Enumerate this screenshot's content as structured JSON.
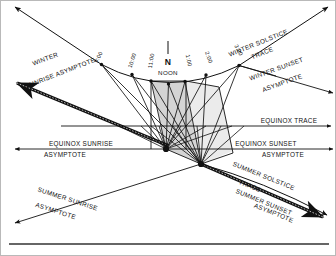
{
  "figure": {
    "background_color": "#ffffff",
    "ink_color": "#111111",
    "frame_color": "#b9b9b9",
    "shade_color": "#c9c9c9"
  },
  "cardinal": {
    "north_label": "N",
    "noon_label": "NOON"
  },
  "hour_marks": [
    {
      "id": "h9",
      "label": "9:00",
      "x": 99,
      "y": 57,
      "rotate": -62,
      "node_x": 100.5,
      "node_y": 63.5
    },
    {
      "id": "h10",
      "label": "10:00",
      "x": 133,
      "y": 60,
      "rotate": -72,
      "node_x": 131,
      "node_y": 73.5
    },
    {
      "id": "h11",
      "label": "11:00",
      "x": 152,
      "y": 60,
      "rotate": -80,
      "node_x": 150,
      "node_y": 80
    },
    {
      "id": "h1",
      "label": "1:00",
      "x": 186,
      "y": 60,
      "rotate": 78,
      "node_x": 184,
      "node_y": 80.5
    },
    {
      "id": "h2",
      "label": "2:00",
      "x": 205,
      "y": 58,
      "rotate": 70,
      "node_x": 205,
      "node_y": 74
    },
    {
      "id": "h3",
      "label": "3:00",
      "x": 236,
      "y": 52,
      "rotate": 62,
      "node_x": 238,
      "node_y": 64.5
    }
  ],
  "noon_node": {
    "node_x": 167.5,
    "node_y": 83
  },
  "traces": [
    {
      "id": "winter-solstice-trace",
      "label": "WINTER SOLSTICE",
      "label2": "TRACE",
      "rotate": -22,
      "label_x": 258,
      "label_y": 44,
      "label2_x": 262,
      "label2_y": 54
    },
    {
      "id": "equinox-trace",
      "label": "EQUINOX  TRACE",
      "rotate": 0,
      "label_x": 255,
      "label_y": 120
    },
    {
      "id": "summer-solstice-trace",
      "label": "SUMMER SOLSTICE",
      "label2": "TRACE",
      "rotate": 22,
      "label_x": 243,
      "label_y": 175,
      "label2_x": 239,
      "label2_y": 185
    }
  ],
  "asymptotes": [
    {
      "id": "winter-sunrise-asymptote",
      "label": "WINTER",
      "label2": "SUNRISE ASYMPTOTE",
      "rotate": -17,
      "label_x": 37,
      "label_y": 60,
      "label2_x": 24,
      "label2_y": 72
    },
    {
      "id": "winter-sunset-asymptote",
      "label": "WINTER SUNSET",
      "label2": "ASYMPTOTE",
      "rotate": -20,
      "label_x": 268,
      "label_y": 68,
      "label2_x": 272,
      "label2_y": 82
    },
    {
      "id": "equinox-sunrise-asymptote",
      "label": "EQUINOX SUNRISE",
      "label2": "ASYMPTOTE",
      "rotate": 0,
      "label_x": 33,
      "label_y": 145,
      "label2_x": 38,
      "label2_y": 155
    },
    {
      "id": "equinox-sunset-asymptote",
      "label": "EQUINOX SUNSET",
      "label2": "ASYMPTOTE",
      "rotate": 0,
      "label_x": 228,
      "label_y": 145,
      "label2_x": 248,
      "label2_y": 155
    },
    {
      "id": "summer-sunrise-asymptote",
      "label": "SUMMER SUNRISE",
      "label2": "ASYMPTOTE",
      "rotate": 22,
      "label_x": 36,
      "label_y": 198,
      "label2_x": 31,
      "label2_y": 208
    },
    {
      "id": "summer-sunset-asymptote",
      "label": "SUMMER SUNSET",
      "label2": "ASYMPTOTE",
      "rotate": 22,
      "label_x": 238,
      "label_y": 198,
      "label2_x": 246,
      "label2_y": 208
    }
  ],
  "geometry": {
    "sunrise_node": {
      "x": 165,
      "y": 148
    },
    "sunset_node": {
      "x": 200,
      "y": 163
    },
    "winter_curve": "M 14,3 L 100.5,63.5 Q 168,96 238,64.5 L 330,3",
    "equinox_line_y": 125,
    "equinox_asym_y": 148,
    "summer_band": "M 18,78 L 320,215",
    "winter_band": "M 16,82 L 318,218"
  }
}
